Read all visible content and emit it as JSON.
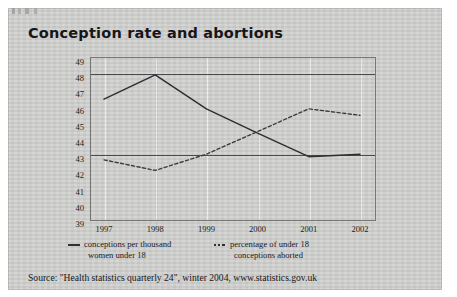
{
  "figure": {
    "title": "Conception rate and abortions",
    "source": "Source: \"Health statistics quarterly 24\", winter 2004, www.statistics.gov.uk"
  },
  "legend": {
    "items": [
      {
        "marker": "solid-line-marker",
        "label_line1": "conceptions per thousand",
        "label_line2": "women under 18"
      },
      {
        "marker": "dashed-line-marker",
        "label_line1": "percentage of under 18",
        "label_line2": "conceptions aborted"
      }
    ]
  },
  "chart_data": {
    "type": "line",
    "title": "Conception rate and abortions",
    "xlabel": "",
    "ylabel": "",
    "x": [
      "1997",
      "1998",
      "1999",
      "2000",
      "2001",
      "2002"
    ],
    "categories": [
      "1997",
      "1998",
      "1999",
      "2000",
      "2001",
      "2002"
    ],
    "ylim": [
      39,
      49
    ],
    "yticks": [
      39,
      40,
      41,
      42,
      43,
      44,
      45,
      46,
      47,
      48,
      49
    ],
    "ytick_labels": [
      "39",
      "40",
      "41",
      "42",
      "43",
      "44",
      "45",
      "46",
      "47",
      "48",
      "49"
    ],
    "grid": "horizontal gridlines at 43 and 48; faint vertical gridlines at each year",
    "gridlines_y": [
      43,
      48
    ],
    "legend_position": "below-axes",
    "series": [
      {
        "name": "conceptions per thousand women under 18",
        "style": "solid",
        "color": "#2f2f33",
        "values": [
          46.4,
          47.9,
          45.8,
          44.3,
          42.85,
          43.0
        ]
      },
      {
        "name": "percentage of under 18 conceptions aborted",
        "style": "dashed",
        "color": "#3a3a3e",
        "values": [
          42.65,
          42.0,
          43.0,
          44.4,
          45.8,
          45.4
        ]
      }
    ],
    "source": "Source: \"Health statistics quarterly 24\", winter 2004, www.statistics.gov.uk"
  }
}
